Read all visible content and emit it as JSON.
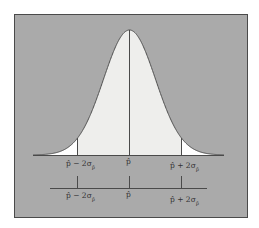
{
  "figure": {
    "type": "normal-distribution-diagram",
    "background_color": "#aaaaaa",
    "frame_color": "#4a4a4a",
    "curve_fill_inner": "#eeeeec",
    "curve_fill_tails": "#ffffff",
    "line_color": "#4a4a4a"
  },
  "upper_axis": {
    "labels": {
      "left": {
        "main": "p̂ − 2σ",
        "sub": "p̂"
      },
      "center": {
        "main": "p̂",
        "sub": ""
      },
      "right": {
        "main": "p̂ + 2σ",
        "sub": "p̂"
      }
    }
  },
  "lower_axis": {
    "labels": {
      "left": {
        "main": "p̂ − 2σ",
        "sub": "p̂"
      },
      "center": {
        "main": "p̂",
        "sub": ""
      },
      "right": {
        "main": "p̂ + 2σ",
        "sub": "p̂"
      }
    }
  },
  "chart_data": {
    "type": "area",
    "title": "",
    "x_ticks": [
      "p̂ − 2σ_p̂",
      "p̂",
      "p̂ + 2σ_p̂"
    ],
    "x_tick_positions_sigma": [
      -2,
      0,
      2
    ],
    "shaded_interval_sigma": [
      -2,
      2
    ],
    "grid": false,
    "legend": "none"
  }
}
